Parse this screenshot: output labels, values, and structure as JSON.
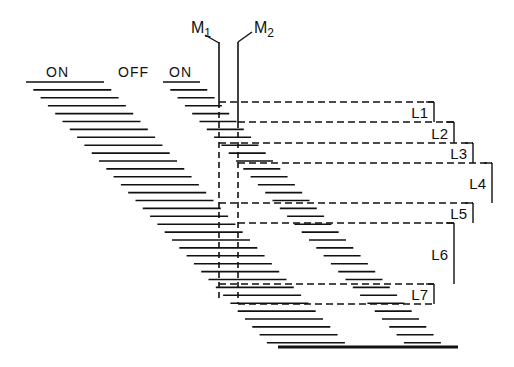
{
  "diagram": {
    "colors": {
      "ink": "#111111",
      "background": "#ffffff"
    },
    "headers": [
      {
        "text": "ON",
        "x": 46,
        "y": 77
      },
      {
        "text": "OFF",
        "x": 118,
        "y": 77
      },
      {
        "text": "ON",
        "x": 169,
        "y": 77
      }
    ],
    "markers": [
      {
        "label": "M",
        "sub": "1",
        "label_x": 191,
        "label_y": 33,
        "line_x": 219,
        "solid_top": 42,
        "solid_bottom": 102,
        "dashed_bottom": 298,
        "leader": [
          [
            205,
            35
          ],
          [
            219,
            43
          ]
        ]
      },
      {
        "label": "M",
        "sub": "2",
        "label_x": 254,
        "label_y": 33,
        "line_x": 238,
        "solid_top": 42,
        "solid_bottom": 122,
        "dashed_bottom": 304,
        "leader": [
          [
            252,
            32
          ],
          [
            238,
            42
          ]
        ]
      }
    ],
    "rows": {
      "count": 34,
      "y_start": 82,
      "y_step": 7.9,
      "band1": {
        "x_start": 26,
        "length": 78,
        "x_step": 7.3
      },
      "band2": {
        "x_start": 163,
        "length": 37,
        "x_step": 7.3,
        "first_row": 0
      },
      "final_line": {
        "x1": 278,
        "x2": 458,
        "y": 347,
        "width": 3
      }
    },
    "brackets": [
      {
        "label": "L1",
        "top": 102,
        "bottom": 122,
        "left": 219,
        "right": 434
      },
      {
        "label": "L2",
        "top": 122,
        "bottom": 143,
        "left": 238,
        "right": 454
      },
      {
        "label": "L3",
        "top": 143,
        "bottom": 163,
        "left": 219,
        "right": 473
      },
      {
        "label": "L4",
        "top": 163,
        "bottom": 203,
        "left": 238,
        "right": 492
      },
      {
        "label": "L5",
        "top": 203,
        "bottom": 223,
        "left": 219,
        "right": 473
      },
      {
        "label": "L6",
        "top": 223,
        "bottom": 284,
        "left": 238,
        "right": 454
      },
      {
        "label": "L7",
        "top": 284,
        "bottom": 304,
        "left": 219,
        "right": 434
      }
    ]
  }
}
